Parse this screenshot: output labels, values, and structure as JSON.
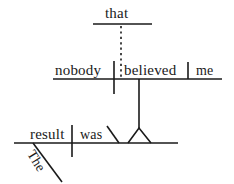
{
  "diagram": {
    "type": "reed-kellogg-sentence-diagram",
    "sentence": "The result was that nobody believed me.",
    "ink_color": "#1a1a1a",
    "background_color": "#ffffff",
    "words": {
      "that": "that",
      "nobody": "nobody",
      "believed": "believed",
      "me": "me",
      "result": "result",
      "was": "was",
      "the": "The"
    },
    "clauses": {
      "subordinate_label": "that nobody believed me",
      "main_label": "The result was"
    },
    "lines": {
      "conjunction_baseline": "that-baseline",
      "subordinate_baseline": "nobody-believed-me-baseline",
      "main_baseline": "the-result-was-baseline",
      "dotted_connector": "that-to-clause-dotted-line",
      "clause_stem": "believed-to-predicate-stem",
      "predicate_marker": "triangle-pedestal",
      "complement_slant": "was-complement-slant",
      "modifier_slant": "the-modifier-slant"
    }
  }
}
